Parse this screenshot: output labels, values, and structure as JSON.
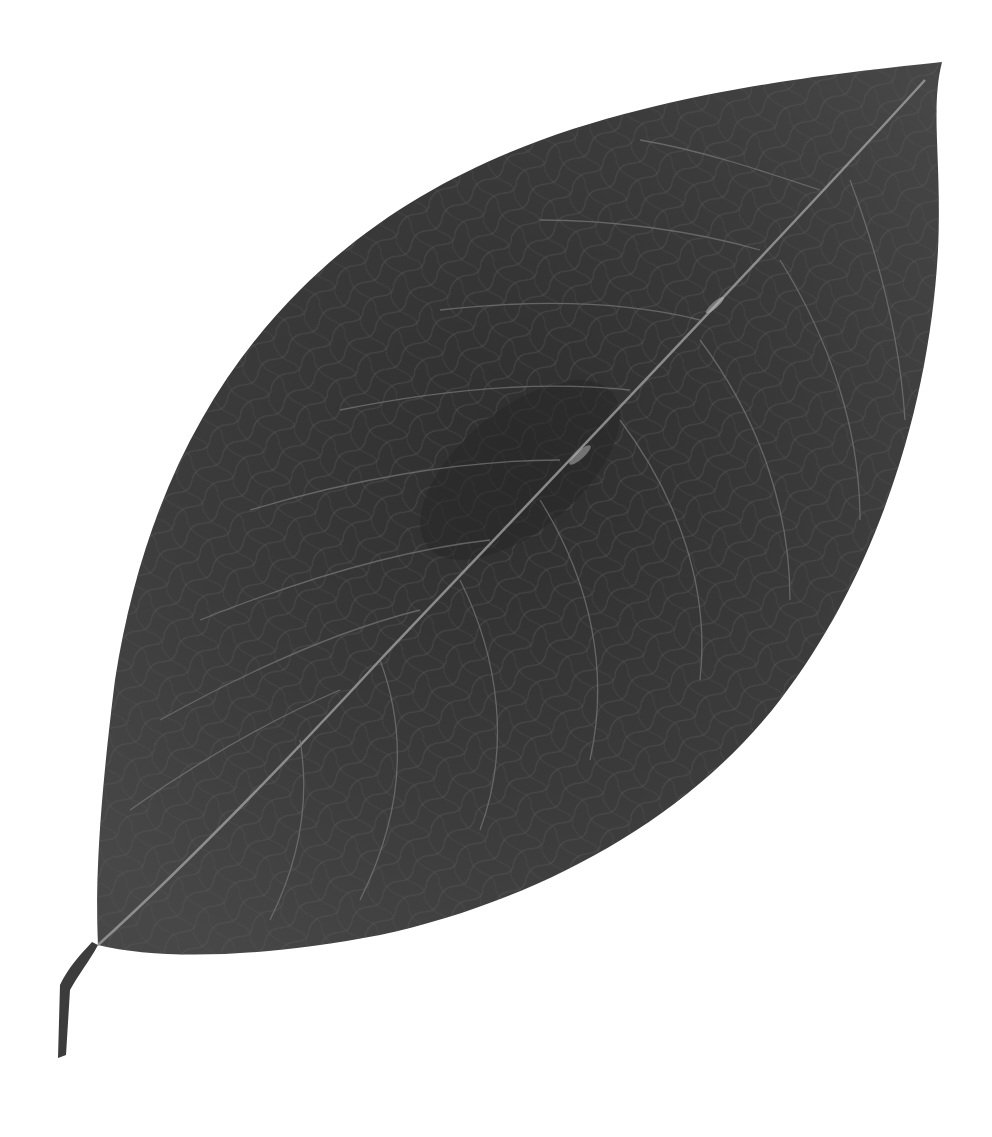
{
  "image": {
    "subject": "Dried leaf, dark grey, photographed on white background",
    "background_color": "#ffffff",
    "leaf_color": "#3a3a3a",
    "leaf_dark_color": "#2a2a2a",
    "vein_color": "#8a8a8a",
    "midrib_color": "#9a9a9a",
    "stem_color": "#3c3c3c"
  }
}
